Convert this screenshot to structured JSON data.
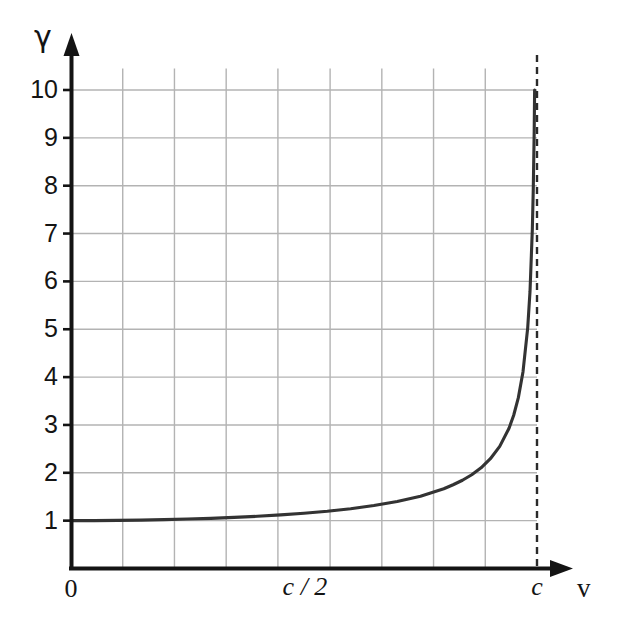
{
  "chart_data": {
    "type": "line",
    "title": "",
    "subtitle": "",
    "xlabel": "v",
    "ylabel": "γ",
    "xlim": [
      0,
      1
    ],
    "ylim": [
      0,
      10.4
    ],
    "grid": true,
    "legend": null,
    "x_tick_labels": [
      "0",
      "c / 2",
      "c"
    ],
    "x_tick_values": [
      0,
      0.5,
      1.0
    ],
    "y_tick_labels": [
      "1",
      "2",
      "3",
      "4",
      "5",
      "6",
      "7",
      "8",
      "9",
      "10"
    ],
    "y_tick_values": [
      1,
      2,
      3,
      4,
      5,
      6,
      7,
      8,
      9,
      10
    ],
    "x_gridline_values": [
      0,
      0.111,
      0.222,
      0.333,
      0.444,
      0.556,
      0.667,
      0.778,
      0.889,
      1.0
    ],
    "annotations": [
      {
        "name": "asymptote",
        "kind": "vertical-dashed-line",
        "x": 1.0,
        "label": "c"
      }
    ],
    "series": [
      {
        "name": "Lorentz factor",
        "formula": "gamma = 1 / sqrt(1 - v^2/c^2)",
        "x": [
          0.0,
          0.05,
          0.1,
          0.15,
          0.2,
          0.25,
          0.3,
          0.35,
          0.4,
          0.45,
          0.5,
          0.55,
          0.6,
          0.65,
          0.7,
          0.75,
          0.8,
          0.82,
          0.84,
          0.86,
          0.88,
          0.9,
          0.92,
          0.94,
          0.95,
          0.96,
          0.97,
          0.98,
          0.985,
          0.99,
          0.992,
          0.994,
          0.9949
        ],
        "values": [
          1.0,
          1.001,
          1.005,
          1.011,
          1.021,
          1.033,
          1.048,
          1.068,
          1.091,
          1.12,
          1.155,
          1.197,
          1.25,
          1.316,
          1.4,
          1.512,
          1.667,
          1.75,
          1.844,
          1.96,
          2.105,
          2.294,
          2.552,
          2.931,
          3.203,
          3.571,
          4.113,
          5.025,
          5.79,
          7.089,
          7.918,
          9.14,
          10.0
        ]
      }
    ],
    "colors": {
      "curve": "#333333",
      "grid": "#b3b3b3",
      "axis": "#141414",
      "asymptote": "#2a2a2a",
      "background": "#ffffff"
    }
  },
  "labels": {
    "y_axis_symbol": "γ",
    "x_axis_symbol": "v",
    "origin": "0",
    "half_c": "c / 2",
    "c": "c",
    "y_ticks": [
      "10",
      "9",
      "8",
      "7",
      "6",
      "5",
      "4",
      "3",
      "2",
      "1"
    ]
  }
}
